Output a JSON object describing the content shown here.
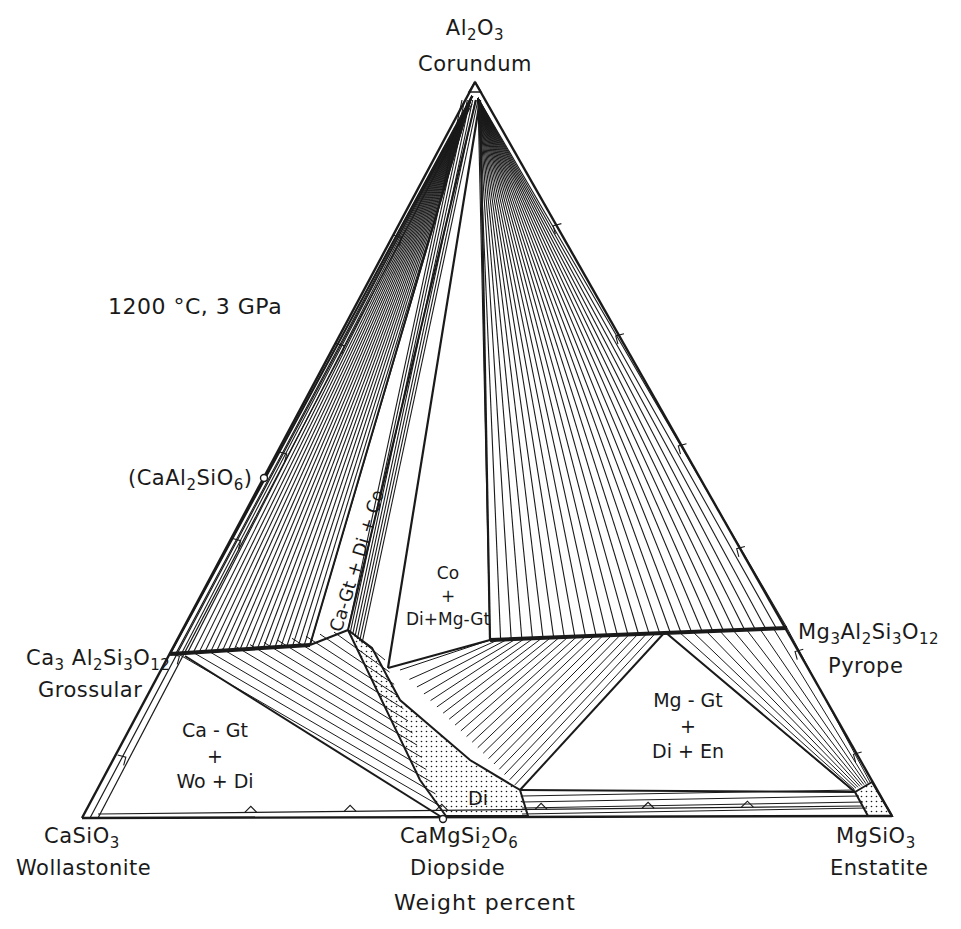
{
  "figure": {
    "condition": "1200 °C, 3 GPa",
    "axis_caption": "Weight percent",
    "colors": {
      "ink": "#1a1a1a",
      "background": "#ffffff",
      "stipple": "#1a1a1a"
    }
  },
  "apices": {
    "top": {
      "formula": [
        "Al",
        "2",
        "O",
        "3"
      ],
      "name": "Corundum",
      "xy": [
        475,
        82
      ]
    },
    "left": {
      "formula": [
        "CaSiO",
        "3"
      ],
      "name": "Wollastonite",
      "xy": [
        82,
        818
      ]
    },
    "right": {
      "formula": [
        "MgSiO",
        "3"
      ],
      "name": "Enstatite",
      "xy": [
        892,
        816
      ]
    }
  },
  "compositions": {
    "grossular": {
      "formula": [
        "Ca",
        "3",
        " Al",
        "2",
        "Si",
        "3",
        "O",
        "12"
      ],
      "name": "Grossular",
      "xy": [
        170,
        654
      ]
    },
    "pyrope": {
      "formula": [
        "Mg",
        "3",
        "Al",
        "2",
        "Si",
        "3",
        "O",
        "12"
      ],
      "name": "Pyrope",
      "xy": [
        787,
        628
      ]
    },
    "diopside": {
      "formula": [
        "CaMgSi",
        "2",
        "O",
        "6"
      ],
      "name": "Diopside",
      "xy": [
        443,
        818
      ]
    },
    "ca_tschermak": {
      "formula": [
        "(CaAl",
        "2",
        "SiO",
        "6",
        ")"
      ],
      "xy": [
        262,
        478
      ]
    }
  },
  "fields": {
    "ca_gt_wo_di": [
      "Ca - Gt",
      "+",
      "Wo + Di"
    ],
    "co_di_mggt": [
      "Co",
      "+",
      "Di+Mg-Gt"
    ],
    "mggt_di_en": [
      "Mg - Gt",
      "+",
      "Di + En"
    ],
    "ca_gt_di_co": "Ca-Gt + Di + Co",
    "di": "Di"
  },
  "chart_data": {
    "type": "ternary_phase_diagram",
    "title": "1200 °C, 3 GPa",
    "subtitle": "Weight percent",
    "components": [
      "Al2O3 (Corundum)",
      "CaSiO3 (Wollastonite)",
      "MgSiO3 (Enstatite)"
    ],
    "phases": [
      "Corundum (Co)",
      "Grossular / Ca-Gt",
      "Pyrope / Mg-Gt",
      "Diopside (Di)",
      "Wollastonite (Wo)",
      "Enstatite (En)",
      "CaAl2SiO6"
    ],
    "three_phase_fields": [
      "Ca-Gt + Wo + Di",
      "Ca-Gt + Di + Co",
      "Co + Di + Mg-Gt",
      "Mg-Gt + Di + En"
    ],
    "single_phase_fields": [
      "Di (stippled)",
      "En (stippled)",
      "Co (stippled at apex)"
    ],
    "garnet_join": "Grossular–Pyrope garnet solid solution (bold line)"
  }
}
